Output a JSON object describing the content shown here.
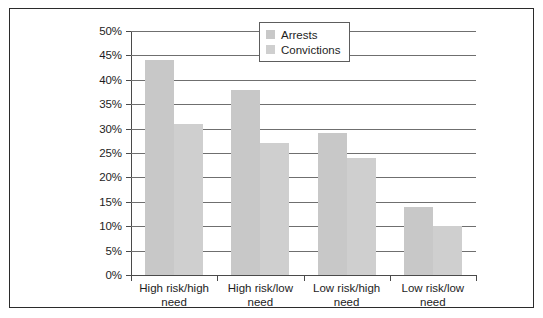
{
  "chart_data": {
    "type": "bar",
    "title": "",
    "xlabel": "",
    "ylabel": "",
    "categories": [
      "High risk/high need",
      "High risk/low need",
      "Low risk/high need",
      "Low risk/low need"
    ],
    "series": [
      {
        "name": "Arrests",
        "values": [
          44,
          38,
          29,
          14
        ],
        "color": "#c8c8c8"
      },
      {
        "name": "Convictions",
        "values": [
          31,
          27,
          24,
          10
        ],
        "color": "#cfcfcf"
      }
    ],
    "ylim": [
      0,
      50
    ],
    "ytick_step": 5,
    "ytick_labels": [
      "0%",
      "5%",
      "10%",
      "15%",
      "20%",
      "25%",
      "30%",
      "35%",
      "40%",
      "45%",
      "50%"
    ],
    "ytick_values": [
      0,
      5,
      10,
      15,
      20,
      25,
      30,
      35,
      40,
      45,
      50
    ],
    "grid": true,
    "legend_position": "top-right",
    "value_suffix": "%"
  },
  "legend": {
    "items": [
      {
        "label": "Arrests"
      },
      {
        "label": "Convictions"
      }
    ]
  },
  "categories": [
    {
      "line1": "High risk/high",
      "line2": "need"
    },
    {
      "line1": "High risk/low",
      "line2": "need"
    },
    {
      "line1": "Low risk/high",
      "line2": "need"
    },
    {
      "line1": "Low risk/low",
      "line2": "need"
    }
  ]
}
